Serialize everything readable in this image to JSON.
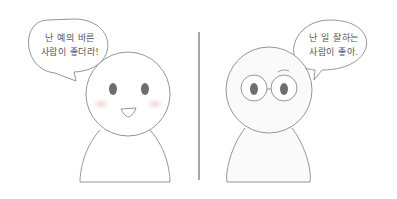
{
  "panels": [
    {
      "character": "smiling-person",
      "speech": {
        "line1": "난 예의 바른",
        "line2": "사람이 좋더라!"
      }
    },
    {
      "character": "glasses-person",
      "speech": {
        "line1": "난 일 잘하는",
        "line2": "사람이 좋아."
      }
    }
  ],
  "colors": {
    "outline": "#8a8a8a",
    "eye": "#6e6e6e",
    "blush": "#f2dede",
    "divider": "#8a8a8a"
  }
}
